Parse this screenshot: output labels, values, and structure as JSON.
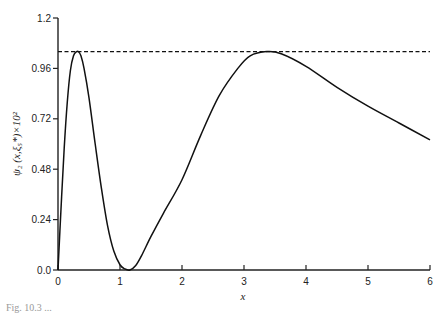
{
  "chart_data": {
    "type": "line",
    "title": "",
    "xlabel": "x",
    "ylabel": "ψ₂ (x,ξ₅*)×10²",
    "xlim": [
      0,
      6
    ],
    "ylim": [
      0,
      1.2
    ],
    "xticks": [
      "0",
      "1",
      "2",
      "3",
      "4",
      "5",
      "6"
    ],
    "yticks": [
      "0.0",
      "0.24",
      "0.48",
      "0.72",
      "0.96",
      "1.2"
    ],
    "grid": false,
    "legend": null,
    "series": [
      {
        "name": "ψ₂(x, ξ₅*)",
        "style": "solid",
        "x": [
          0,
          0.05,
          0.1,
          0.15,
          0.2,
          0.25,
          0.3,
          0.33,
          0.37,
          0.42,
          0.5,
          0.6,
          0.7,
          0.8,
          0.9,
          1.0,
          1.08,
          1.16,
          1.25,
          1.35,
          1.5,
          1.7,
          2.0,
          2.3,
          2.6,
          2.9,
          3.1,
          3.37,
          3.6,
          4.0,
          4.5,
          5.0,
          5.5,
          6.0
        ],
        "y": [
          0,
          0.3,
          0.58,
          0.8,
          0.95,
          1.02,
          1.04,
          1.04,
          1.02,
          0.96,
          0.82,
          0.6,
          0.39,
          0.21,
          0.09,
          0.025,
          0.005,
          0.0,
          0.02,
          0.07,
          0.16,
          0.27,
          0.43,
          0.64,
          0.83,
          0.96,
          1.02,
          1.04,
          1.03,
          0.97,
          0.87,
          0.78,
          0.7,
          0.62
        ]
      },
      {
        "name": "maximum",
        "style": "dashed",
        "x": [
          0,
          6
        ],
        "y": [
          1.04,
          1.04
        ]
      }
    ]
  },
  "caption": "Fig. 10.3 ..."
}
